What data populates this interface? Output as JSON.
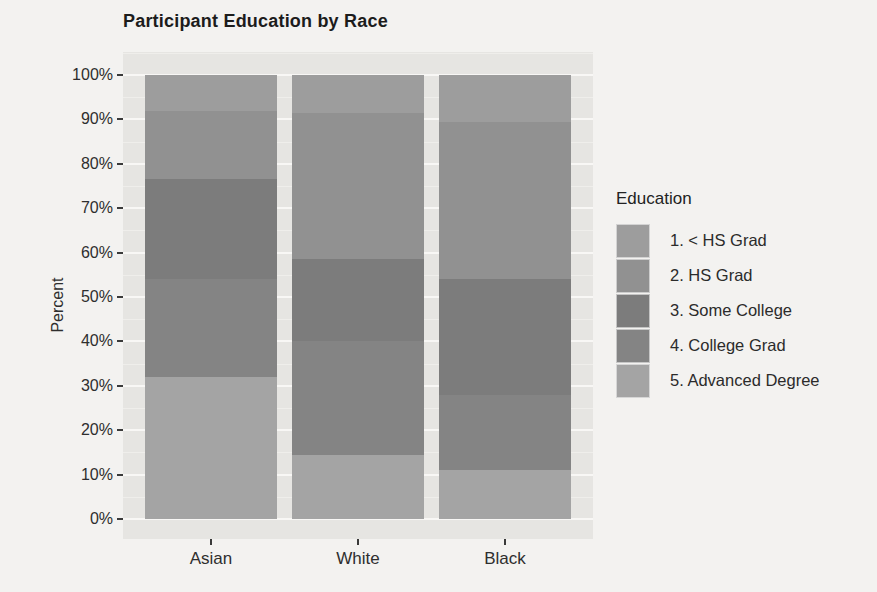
{
  "chart_data": {
    "type": "bar",
    "variant": "stacked-percent",
    "title": "Participant Education by Race",
    "xlabel": "",
    "ylabel": "Percent",
    "ylim": [
      0,
      100
    ],
    "yticks": [
      "0%",
      "10%",
      "20%",
      "30%",
      "40%",
      "50%",
      "60%",
      "70%",
      "80%",
      "90%",
      "100%"
    ],
    "grid": "horizontal white major (10%) and minor (5%) lines on gray panel",
    "legend_title": "Education",
    "legend_position": "right",
    "stack_order": "first series at top of bar",
    "categories": [
      "Asian",
      "White",
      "Black"
    ],
    "series": [
      {
        "name": "1. < HS Grad",
        "color": "#9d9d9d",
        "values": [
          8,
          8.5,
          10.5
        ]
      },
      {
        "name": "2. HS Grad",
        "color": "#919191",
        "values": [
          15.5,
          33,
          35.5
        ]
      },
      {
        "name": "3. Some College",
        "color": "#7c7c7c",
        "values": [
          22.5,
          18.5,
          26
        ]
      },
      {
        "name": "4. College Grad",
        "color": "#848484",
        "values": [
          22,
          25.5,
          17
        ]
      },
      {
        "name": "5. Advanced Degree",
        "color": "#a4a4a4",
        "values": [
          32,
          14.5,
          11
        ]
      }
    ],
    "panel_bg": "#e6e5e2",
    "page_bg": "#f3f2f0"
  }
}
